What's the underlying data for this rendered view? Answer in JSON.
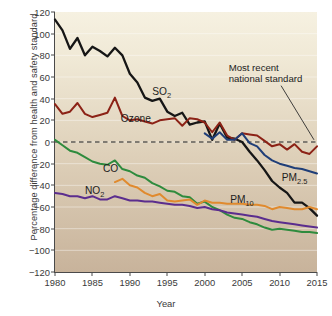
{
  "chart_data": {
    "type": "line",
    "title": "",
    "xlabel": "Year",
    "ylabel": "Percentage difference from health and safety standard",
    "xlim": [
      1980,
      2015
    ],
    "ylim": [
      -120,
      120
    ],
    "xticks": [
      1980,
      1985,
      1990,
      1995,
      2000,
      2005,
      2010,
      2015
    ],
    "yticks": [
      120,
      100,
      80,
      60,
      40,
      20,
      0,
      -20,
      -40,
      -60,
      -80,
      -100,
      -120
    ],
    "grid": "horizontal-faint",
    "legend": "inline-labels",
    "zero_reference_line": {
      "value": 0,
      "style": "dashed",
      "color": "#1a1a1a"
    },
    "annotations": [
      {
        "name": "most-recent-national-standard",
        "text_line1": "Most recent",
        "text_line2": "national standard",
        "points_to": "zero-dashed-line-at-2015"
      }
    ],
    "series": [
      {
        "name": "SO2",
        "label": "SO",
        "label_sub": "2",
        "color": "#161616",
        "x": [
          1980,
          1981,
          1982,
          1983,
          1984,
          1985,
          1986,
          1987,
          1988,
          1989,
          1990,
          1991,
          1992,
          1993,
          1994,
          1995,
          1996,
          1997,
          1998,
          1999,
          2000,
          2001,
          2002,
          2003,
          2004,
          2005,
          2006,
          2007,
          2008,
          2009,
          2010,
          2011,
          2012,
          2013,
          2014,
          2015
        ],
        "values": [
          113,
          103,
          86,
          96,
          80,
          88,
          84,
          79,
          87,
          80,
          63,
          55,
          41,
          38,
          40,
          28,
          24,
          27,
          16,
          18,
          19,
          2,
          17,
          4,
          3,
          0,
          -9,
          -17,
          -26,
          -36,
          -42,
          -47,
          -56,
          -56,
          -61,
          -68
        ]
      },
      {
        "name": "Ozone",
        "label": "Ozone",
        "label_sub": "",
        "color": "#8c2216",
        "x": [
          1980,
          1981,
          1982,
          1983,
          1984,
          1985,
          1986,
          1987,
          1988,
          1989,
          1990,
          1991,
          1992,
          1993,
          1994,
          1995,
          1996,
          1997,
          1998,
          1999,
          2000,
          2001,
          2002,
          2003,
          2004,
          2005,
          2006,
          2007,
          2008,
          2009,
          2010,
          2011,
          2012,
          2013,
          2014,
          2015
        ],
        "values": [
          35,
          26,
          28,
          36,
          26,
          23,
          25,
          27,
          41,
          24,
          20,
          21,
          19,
          17,
          20,
          21,
          22,
          15,
          22,
          21,
          18,
          9,
          18,
          6,
          2,
          8,
          7,
          6,
          1,
          -4,
          -2,
          -7,
          -2,
          -9,
          -11,
          -4
        ]
      },
      {
        "name": "CO",
        "label": "CO",
        "label_sub": "",
        "color": "#2e8b3d",
        "x": [
          1980,
          1981,
          1982,
          1983,
          1984,
          1985,
          1986,
          1987,
          1988,
          1989,
          1990,
          1991,
          1992,
          1993,
          1994,
          1995,
          1996,
          1997,
          1998,
          1999,
          2000,
          2001,
          2002,
          2003,
          2004,
          2005,
          2006,
          2007,
          2008,
          2009,
          2010,
          2011,
          2012,
          2013,
          2014,
          2015
        ],
        "values": [
          2,
          -3,
          -8,
          -10,
          -14,
          -18,
          -20,
          -21,
          -17,
          -25,
          -27,
          -31,
          -33,
          -38,
          -41,
          -45,
          -46,
          -50,
          -51,
          -57,
          -55,
          -60,
          -63,
          -67,
          -70,
          -71,
          -74,
          -76,
          -79,
          -81,
          -80,
          -81,
          -82,
          -83,
          -83,
          -84
        ]
      },
      {
        "name": "NO2",
        "label": "NO",
        "label_sub": "2",
        "color": "#5b2d8e",
        "x": [
          1980,
          1981,
          1982,
          1983,
          1984,
          1985,
          1986,
          1987,
          1988,
          1989,
          1990,
          1991,
          1992,
          1993,
          1994,
          1995,
          1996,
          1997,
          1998,
          1999,
          2000,
          2001,
          2002,
          2003,
          2004,
          2005,
          2006,
          2007,
          2008,
          2009,
          2010,
          2011,
          2012,
          2013,
          2014,
          2015
        ],
        "values": [
          -47,
          -48,
          -50,
          -50,
          -52,
          -50,
          -53,
          -53,
          -50,
          -52,
          -54,
          -54,
          -55,
          -55,
          -56,
          -57,
          -58,
          -58,
          -59,
          -61,
          -60,
          -62,
          -63,
          -65,
          -66,
          -67,
          -68,
          -69,
          -71,
          -73,
          -74,
          -75,
          -76,
          -77,
          -78,
          -79
        ]
      },
      {
        "name": "PM10",
        "label": "PM",
        "label_sub": "10",
        "color": "#e08a2e",
        "x": [
          1988,
          1989,
          1990,
          1991,
          1992,
          1993,
          1994,
          1995,
          1996,
          1997,
          1998,
          1999,
          2000,
          2001,
          2002,
          2003,
          2004,
          2005,
          2006,
          2007,
          2008,
          2009,
          2010,
          2011,
          2012,
          2013,
          2014,
          2015
        ],
        "values": [
          -37,
          -34,
          -40,
          -42,
          -47,
          -50,
          -48,
          -54,
          -55,
          -54,
          -53,
          -58,
          -54,
          -56,
          -56,
          -57,
          -57,
          -57,
          -58,
          -58,
          -59,
          -62,
          -60,
          -61,
          -62,
          -62,
          -60,
          -62
        ]
      },
      {
        "name": "PM2.5",
        "label": "PM",
        "label_sub": "2.5",
        "color": "#1f3e78",
        "x": [
          2000,
          2001,
          2002,
          2003,
          2004,
          2005,
          2006,
          2007,
          2008,
          2009,
          2010,
          2011,
          2012,
          2013,
          2014,
          2015
        ],
        "values": [
          8,
          3,
          9,
          2,
          2,
          8,
          -1,
          -4,
          -12,
          -17,
          -20,
          -22,
          -24,
          -25,
          -27,
          -29
        ]
      }
    ]
  },
  "axis": {
    "x_tick_labels": [
      "1980",
      "1985",
      "1990",
      "1995",
      "2000",
      "2005",
      "2010",
      "2015"
    ],
    "y_tick_labels": [
      "120",
      "100",
      "80",
      "60",
      "40",
      "20",
      "0",
      "−20",
      "−40",
      "−60",
      "−80",
      "−100",
      "−120"
    ],
    "x_title": "Year",
    "y_title": "Percentage difference from health and safety standard"
  },
  "series_labels": {
    "so2": "SO",
    "so2_sub": "2",
    "ozone": "Ozone",
    "co": "CO",
    "no2": "NO",
    "no2_sub": "2",
    "pm10": "PM",
    "pm10_sub": "10",
    "pm25": "PM",
    "pm25_sub": "2.5"
  },
  "annotation": {
    "line1": "Most recent",
    "line2": "national standard"
  },
  "colors": {
    "so2": "#161616",
    "ozone": "#8c2216",
    "co": "#2e8b3d",
    "no2": "#5b2d8e",
    "pm10": "#e08a2e",
    "pm25": "#1f3e78",
    "plot_bg_top": "#f6f1e1",
    "plot_bg_bottom": "#c8b39b",
    "axis": "#4a4a4a"
  }
}
